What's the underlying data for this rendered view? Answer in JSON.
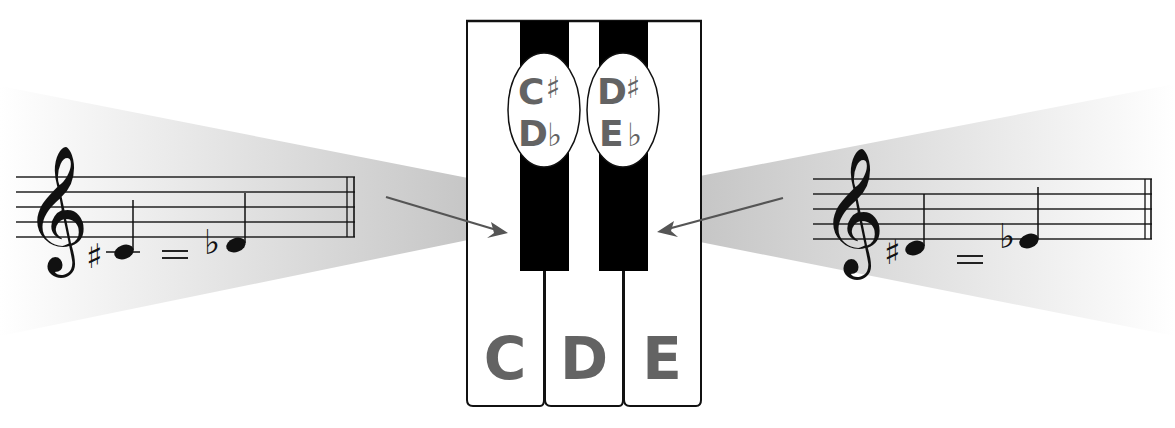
{
  "colors": {
    "label_gray": "#636363",
    "arrow_gray": "#555555",
    "beam_gray": "#c9c9c9",
    "key_black": "#000000",
    "key_white": "#ffffff"
  },
  "keyboard": {
    "white_keys": [
      {
        "label": "C"
      },
      {
        "label": "D"
      },
      {
        "label": "E"
      }
    ],
    "black_keys": [
      {
        "sharp_name": "C",
        "sharp_sym": "♯",
        "flat_name": "D",
        "flat_sym": "♭"
      },
      {
        "sharp_name": "D",
        "sharp_sym": "♯",
        "flat_name": "E",
        "flat_sym": "♭"
      }
    ]
  },
  "left_staff": {
    "clef": "𝄞",
    "note1_accidental": "♯",
    "note1_name": "C♯",
    "equals": "=",
    "note2_accidental": "♭",
    "note2_name": "D♭"
  },
  "right_staff": {
    "clef": "𝄞",
    "note1_accidental": "♯",
    "note1_name": "D♯",
    "equals": "=",
    "note2_accidental": "♭",
    "note2_name": "E♭"
  }
}
